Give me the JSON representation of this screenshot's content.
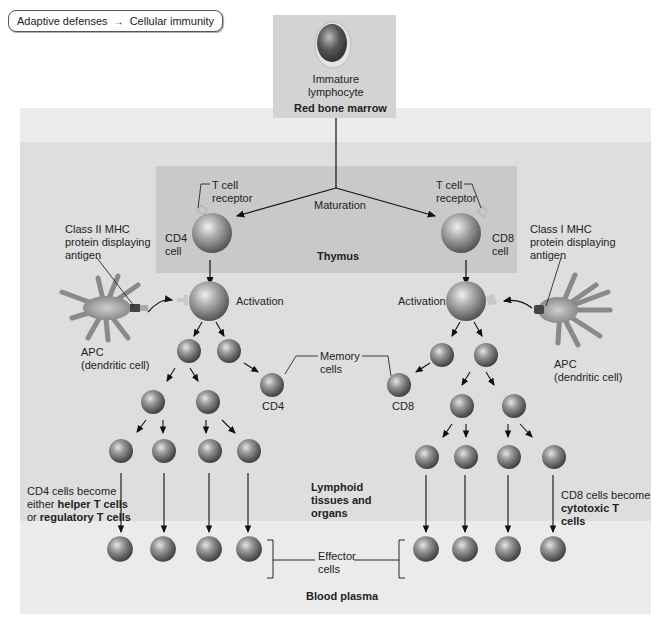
{
  "breadcrumb": {
    "parent": "Adaptive defenses",
    "arrow": "→",
    "current": "Cellular immunity"
  },
  "regions": {
    "red_bone_marrow": "Red bone marrow",
    "thymus": "Thymus",
    "lymphoid": [
      "Lymphoid",
      "tissues and",
      "organs"
    ],
    "blood_plasma": "Blood plasma"
  },
  "labels": {
    "immature_lymphocyte": [
      "Immature",
      "lymphocyte"
    ],
    "maturation": "Maturation",
    "tcr_left": [
      "T cell",
      "receptor"
    ],
    "tcr_right": [
      "T cell",
      "receptor"
    ],
    "cd4_cell": [
      "CD4",
      "cell"
    ],
    "cd8_cell": [
      "CD8",
      "cell"
    ],
    "class2_mhc": [
      "Class II MHC",
      "protein displaying",
      "antigen"
    ],
    "class1_mhc": [
      "Class I MHC",
      "protein displaying",
      "antigen"
    ],
    "activation_left": "Activation",
    "activation_right": "Activation",
    "apc_left": [
      "APC",
      "(dendritic cell)"
    ],
    "apc_right": [
      "APC",
      "(dendritic cell)"
    ],
    "memory_cells": [
      "Memory",
      "cells"
    ],
    "memory_cd4": "CD4",
    "memory_cd8": "CD8",
    "cd4_fate": {
      "line1": "CD4 cells become",
      "line2_pre": "either ",
      "line2_bold": "helper T cells",
      "line3_pre": "or ",
      "line3_bold": "regulatory T cells"
    },
    "cd8_fate": {
      "line1": "CD8 cells become",
      "line2_bold": "cytotoxic T",
      "line3_bold": "cells"
    },
    "effector_cells": [
      "Effector",
      "cells"
    ]
  },
  "colors": {
    "outer_band": "#ececec",
    "lymphoid_bg": "#dedede",
    "plasma_bg": "#ebebeb",
    "marrow_box": "#d3d3d3",
    "thymus_box": "#c9c9c9",
    "cell_dark": "#4a4a4a",
    "cell_light": "#bdbdbd"
  }
}
